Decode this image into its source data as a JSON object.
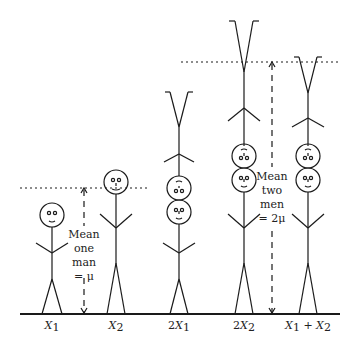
{
  "diagram": {
    "figures": [
      {
        "id": "X1",
        "label_pre": "",
        "label_var": "X",
        "label_sub": "1",
        "label_post": ""
      },
      {
        "id": "X2",
        "label_pre": "",
        "label_var": "X",
        "label_sub": "2",
        "label_post": ""
      },
      {
        "id": "2X1",
        "label_pre": "2",
        "label_var": "X",
        "label_sub": "1",
        "label_post": ""
      },
      {
        "id": "2X2",
        "label_pre": "2",
        "label_var": "X",
        "label_sub": "2",
        "label_post": ""
      },
      {
        "id": "X1+X2",
        "label_pre": "",
        "label_var": "X",
        "label_sub": "1",
        "label_post": " + X₂"
      }
    ],
    "labels": {
      "x1": "X",
      "x1_sub": "1",
      "x2": "X",
      "x2_sub": "2",
      "two_x1_pre": "2",
      "two_x1": "X",
      "two_x1_sub": "1",
      "two_x2_pre": "2",
      "two_x2": "X",
      "two_x2_sub": "2",
      "sum_a": "X",
      "sum_a_sub": "1",
      "sum_plus": " + ",
      "sum_b": "X",
      "sum_b_sub": "2"
    },
    "annotation_one": {
      "line1": "Mean",
      "line2": "one",
      "line3": "man",
      "line4": "= μ"
    },
    "annotation_two": {
      "line1": "Mean",
      "line2": "two",
      "line3": "men",
      "line4": "= 2μ"
    },
    "colors": {
      "stroke": "#1a1a1a",
      "background": "#ffffff"
    }
  }
}
